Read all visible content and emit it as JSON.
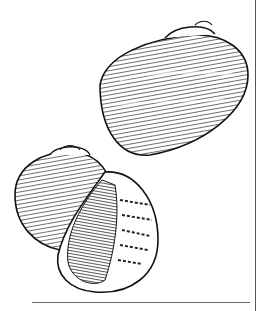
{
  "illustration": {
    "subject": "two snail shells line drawing",
    "ink_color": "#1a1a1a",
    "background": "#ffffff"
  }
}
